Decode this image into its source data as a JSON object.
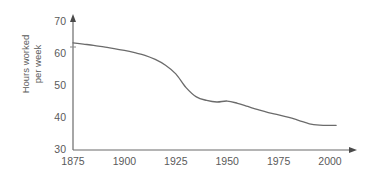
{
  "chart_data": {
    "type": "line",
    "title": "",
    "subtitle": "",
    "xlabel": "",
    "ylabel": "Hours worked per week",
    "ylabel_lines": [
      "Hours worked",
      "per week"
    ],
    "xlim": [
      1875,
      2003
    ],
    "ylim": [
      28,
      73
    ],
    "yticks": [
      30,
      40,
      50,
      60,
      70
    ],
    "ytick_labels": [
      "30",
      "40",
      "50",
      "60",
      "70"
    ],
    "xticks": [
      1875,
      1900,
      1925,
      1950,
      1975,
      2000
    ],
    "xtick_labels": [
      "1875",
      "1900",
      "1925",
      "1950",
      "1975",
      "2000"
    ],
    "grid": false,
    "legend": null,
    "line_color": "#6b6b6b",
    "axis_color": "#6b6b6b",
    "series": [
      {
        "name": "Hours worked per week",
        "x": [
          1875,
          1880,
          1885,
          1890,
          1895,
          1900,
          1905,
          1910,
          1915,
          1920,
          1925,
          1930,
          1935,
          1940,
          1945,
          1950,
          1955,
          1960,
          1965,
          1970,
          1975,
          1980,
          1985,
          1990,
          1995,
          2000,
          2003
        ],
        "values": [
          63.5,
          63.1,
          62.7,
          62.2,
          61.7,
          61.1,
          60.4,
          59.6,
          58.3,
          56.5,
          53.8,
          49.5,
          46.6,
          45.5,
          45.0,
          45.3,
          44.6,
          43.6,
          42.6,
          41.7,
          41.0,
          40.2,
          39.2,
          38.2,
          37.8,
          37.7,
          37.7
        ]
      }
    ],
    "annotations": []
  },
  "axes": {
    "y_axis_name": "y-axis",
    "x_axis_name": "x-axis",
    "arrow_y": "up-arrow",
    "arrow_x": "right-arrow"
  }
}
